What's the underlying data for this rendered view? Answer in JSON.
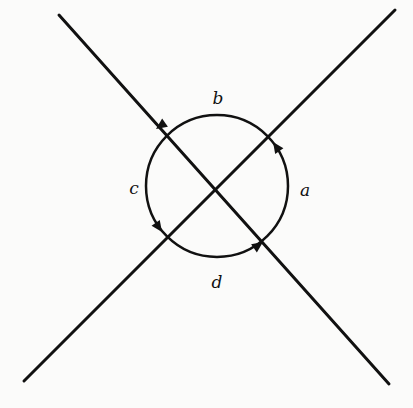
{
  "diagram": {
    "type": "two crossing lines with oriented circle around intersection",
    "stroke_color": "#111111",
    "background": "#fbfbfa",
    "lines": [
      {
        "name": "line-descending",
        "from": [
          59,
          15
        ],
        "to": [
          389,
          384
        ]
      },
      {
        "name": "line-ascending",
        "from": [
          395,
          10
        ],
        "to": [
          24,
          381
        ]
      }
    ],
    "circle": {
      "cx": 217,
      "cy": 186,
      "r": 71,
      "orientation": "counterclockwise"
    },
    "arcs": [
      {
        "label": "a",
        "position": "right",
        "label_xy": [
          305,
          191
        ]
      },
      {
        "label": "b",
        "position": "top",
        "label_xy": [
          218,
          98
        ]
      },
      {
        "label": "c",
        "position": "left",
        "label_xy": [
          134,
          188
        ]
      },
      {
        "label": "d",
        "position": "bottom",
        "label_xy": [
          217,
          283
        ]
      }
    ],
    "arrows": [
      {
        "arc": "b",
        "at": [
          157,
          129
        ],
        "direction_deg": 215
      },
      {
        "arc": "a",
        "at": [
          274,
          144
        ],
        "direction_deg": -100
      },
      {
        "arc": "c",
        "at": [
          162,
          230
        ],
        "direction_deg": 70
      },
      {
        "arc": "d",
        "at": [
          262,
          243
        ],
        "direction_deg": -25
      }
    ]
  }
}
